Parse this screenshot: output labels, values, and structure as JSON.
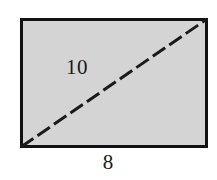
{
  "figure": {
    "type": "geometry-diagram",
    "background_color": "#ffffff",
    "rectangle": {
      "fill_color": "#d4d4d4",
      "stroke_color": "#111111",
      "stroke_width": 3,
      "x": 20,
      "y": 18,
      "width": 188,
      "height": 130
    },
    "diagonal": {
      "name": "dashed-diagonal",
      "stroke_color": "#1a1a1a",
      "stroke_width": 3,
      "dash_pattern": "15 5",
      "x1": 21,
      "y1": 147,
      "x2": 207,
      "y2": 19
    },
    "labels": {
      "diagonal": "10",
      "base": "8"
    }
  }
}
